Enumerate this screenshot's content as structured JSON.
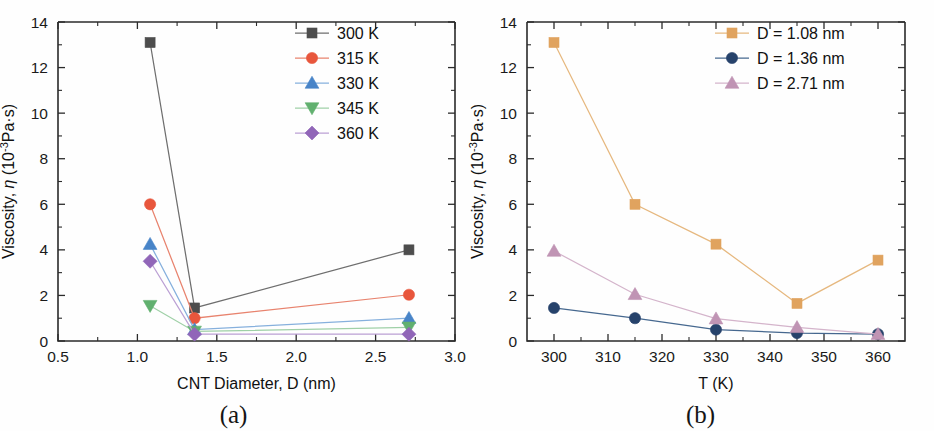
{
  "figure": {
    "background": "#fefefe",
    "panels": [
      {
        "id": "a",
        "caption": "(a)",
        "chart_key": 0
      },
      {
        "id": "b",
        "caption": "(b)",
        "chart_key": 1
      }
    ]
  },
  "chart_data": [
    {
      "type": "line",
      "panel": "(a)",
      "title": "",
      "xlabel": "CNT Diameter, D (nm)",
      "ylabel_prefix": "Viscosity, ",
      "ylabel_eta": "η",
      "ylabel_unit_open": " (10",
      "ylabel_unit_sup": "-3",
      "ylabel_unit_close": "Pa·s)",
      "ylabel_full": "Viscosity, η (10-3Pa·s)",
      "xlim": [
        0.5,
        3.0
      ],
      "ylim": [
        0,
        14
      ],
      "xticks": [
        0.5,
        1.0,
        1.5,
        2.0,
        2.5,
        3.0
      ],
      "xticklabels": [
        "0.5",
        "1.0",
        "1.5",
        "2.0",
        "2.5",
        "3.0"
      ],
      "yticks": [
        0,
        2,
        4,
        6,
        8,
        10,
        12,
        14
      ],
      "yticklabels": [
        "0",
        "2",
        "4",
        "6",
        "8",
        "10",
        "12",
        "14"
      ],
      "grid": false,
      "legend_position": "top-right",
      "x": [
        1.08,
        1.36,
        2.71
      ],
      "series": [
        {
          "name": "300 K",
          "marker": "square",
          "color": "#4d4d4d",
          "line_color": "#6e6e6e",
          "values": [
            13.1,
            1.45,
            4.0
          ]
        },
        {
          "name": "315 K",
          "marker": "circle",
          "color": "#e8563c",
          "line_color": "#e8836e",
          "values": [
            6.0,
            1.0,
            2.03
          ]
        },
        {
          "name": "330 K",
          "marker": "triangle-up",
          "color": "#4884c8",
          "line_color": "#86b0dd",
          "values": [
            4.25,
            0.5,
            1.0
          ]
        },
        {
          "name": "345 K",
          "marker": "triangle-down",
          "color": "#61b06f",
          "line_color": "#9fd0a7",
          "values": [
            1.55,
            0.42,
            0.6
          ]
        },
        {
          "name": "360 K",
          "marker": "diamond",
          "color": "#9166b8",
          "line_color": "#bba0d4",
          "values": [
            3.5,
            0.3,
            0.3
          ]
        }
      ]
    },
    {
      "type": "line",
      "panel": "(b)",
      "title": "",
      "xlabel": "T (K)",
      "ylabel_prefix": "Viscosity, ",
      "ylabel_eta": "η",
      "ylabel_unit_open": " (10",
      "ylabel_unit_sup": "-3",
      "ylabel_unit_close": "Pa·s)",
      "ylabel_full": "Viscosity, η (10-3Pa·s)",
      "xlim": [
        295,
        365
      ],
      "ylim": [
        0,
        14
      ],
      "xticks": [
        300,
        310,
        320,
        330,
        340,
        350,
        360
      ],
      "xticklabels": [
        "300",
        "310",
        "320",
        "330",
        "340",
        "350",
        "360"
      ],
      "yticks": [
        0,
        2,
        4,
        6,
        8,
        10,
        12,
        14
      ],
      "yticklabels": [
        "0",
        "2",
        "4",
        "6",
        "8",
        "10",
        "12",
        "14"
      ],
      "grid": false,
      "legend_position": "top-right",
      "x": [
        300,
        315,
        330,
        345,
        360
      ],
      "series": [
        {
          "name": "D = 1.08 nm",
          "marker": "square",
          "color": "#e0a35f",
          "line_color": "#e6b87f",
          "values": [
            13.1,
            6.0,
            4.25,
            1.65,
            3.55
          ]
        },
        {
          "name": "D = 1.36 nm",
          "marker": "circle",
          "color": "#26426b",
          "line_color": "#46688f",
          "values": [
            1.45,
            1.0,
            0.5,
            0.35,
            0.3
          ]
        },
        {
          "name": "D = 2.71 nm",
          "marker": "triangle-up",
          "color": "#c094b4",
          "line_color": "#d4b4cb",
          "values": [
            3.95,
            2.05,
            0.98,
            0.6,
            0.3
          ]
        }
      ]
    }
  ]
}
